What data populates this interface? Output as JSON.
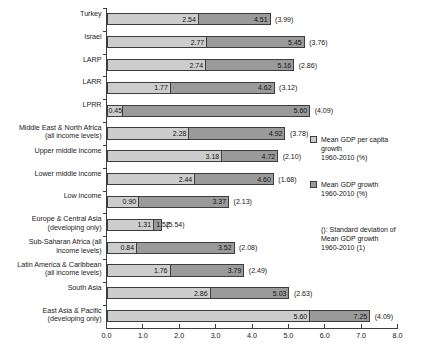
{
  "chart_data": {
    "type": "bar",
    "title": "",
    "subtitle": "",
    "orientation": "horizontal",
    "stacked_overlay": true,
    "xlabel": "",
    "ylabel": "",
    "xlim": [
      0.0,
      8.0
    ],
    "xticks": [
      "0.0",
      "1.0",
      "2.0",
      "3.0",
      "4.0",
      "5.0",
      "6.0",
      "7.0",
      "8.0"
    ],
    "xtick_values": [
      0.0,
      1.0,
      2.0,
      3.0,
      4.0,
      5.0,
      6.0,
      7.0,
      8.0
    ],
    "grid": false,
    "legend_position": "right",
    "categories": [
      "Turkey",
      "Israel",
      "LARP",
      "LARR",
      "LPRR",
      "Middle East & North Africa\n(all income levels)",
      "Upper middle income",
      "Lower middle income",
      "Low income",
      "Europe & Central Asia\n(developing only)",
      "Sub-Saharan Africa (all\nincome levels)",
      "Latin America & Caribbean\n(all income levels)",
      "South Asia",
      "East Asia & Pacific\n(developing only)"
    ],
    "series": [
      {
        "name": "Mean GDP per capita growth 1960-2010 (%)",
        "color": "#cdcdcd",
        "values": [
          2.54,
          2.77,
          2.74,
          1.77,
          0.45,
          2.28,
          3.18,
          2.44,
          0.9,
          1.31,
          0.84,
          1.76,
          2.86,
          5.6
        ],
        "labels": [
          "2.54",
          "2.77",
          "2.74",
          "1.77",
          "0.45",
          "2.28",
          "3.18",
          "2.44",
          "0.90",
          "1.31",
          "0.84",
          "1.76",
          "2.86",
          "5.60"
        ]
      },
      {
        "name": "Mean GDP growth 1960-2010 (%)",
        "color": "#9a9a9a",
        "values": [
          4.51,
          5.45,
          5.16,
          4.62,
          5.6,
          4.92,
          4.72,
          4.6,
          3.37,
          1.52,
          3.52,
          3.79,
          5.03,
          7.25
        ],
        "labels": [
          "4.51",
          "5.45",
          "5.16",
          "4.62",
          "5.60",
          "4.92",
          "4.72",
          "4.60",
          "3.37",
          "1.52",
          "3.52",
          "3.79",
          "5.03",
          "7.25"
        ]
      },
      {
        "name": "(): Standard deviation of Mean GDP growth 1960-2010 (1)",
        "values": [
          3.99,
          3.76,
          2.86,
          3.12,
          4.09,
          3.78,
          2.1,
          1.68,
          2.13,
          5.54,
          2.08,
          2.49,
          2.63,
          4.09
        ],
        "labels": [
          "(3.99)",
          "(3.76)",
          "(2.86)",
          "(3.12)",
          "(4.09)",
          "(3.78)",
          "(2.10)",
          "(1.68)",
          "(2.13)",
          "(5.54)",
          "(2.08)",
          "(2.49)",
          "(2.63)",
          "(4.09)"
        ]
      }
    ]
  },
  "legend": {
    "items": [
      {
        "swatch": "#cdcdcd",
        "label": "Mean GDP per capita\ngrowth\n1960-2010 (%)"
      },
      {
        "swatch": "#9a9a9a",
        "label": "Mean GDP growth\n1960-2010 (%)"
      }
    ],
    "note": "(): Standard deviation of\nMean GDP growth\n1960-2010 (1)"
  },
  "colors": {
    "light_bar": "#cdcdcd",
    "dark_bar": "#9a9a9a",
    "axis": "#3d3d3d",
    "text": "#141414",
    "background": "#ffffff"
  }
}
